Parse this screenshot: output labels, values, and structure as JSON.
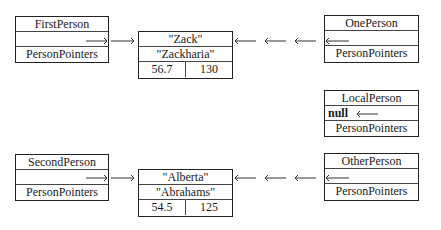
{
  "diagram": {
    "pointer_boxes": [
      {
        "name": "FirstPerson",
        "label": "FirstPerson",
        "type_label": "PersonPointers",
        "value": "",
        "points_to": "Zack"
      },
      {
        "name": "OnePerson",
        "label": "OnePerson",
        "type_label": "PersonPointers",
        "value": "",
        "points_to": "Zack"
      },
      {
        "name": "LocalPerson",
        "label": "LocalPerson",
        "type_label": "PersonPointers",
        "value": "null",
        "points_to": null
      },
      {
        "name": "SecondPerson",
        "label": "SecondPerson",
        "type_label": "PersonPointers",
        "value": "",
        "points_to": "Alberta"
      },
      {
        "name": "OtherPerson",
        "label": "OtherPerson",
        "type_label": "PersonPointers",
        "value": "",
        "points_to": "Alberta"
      }
    ],
    "records": [
      {
        "first": "\"Zack\"",
        "last": "\"Zackharia\"",
        "weight": "56.7",
        "height": "130"
      },
      {
        "first": "\"Alberta\"",
        "last": "\"Abrahams\"",
        "weight": "54.5",
        "height": "125"
      }
    ]
  }
}
